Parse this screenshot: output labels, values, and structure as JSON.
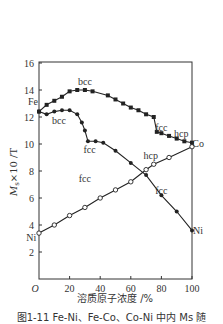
{
  "chart_data": {
    "type": "line",
    "title": "",
    "xlabel": "溶质原子浓度 /%",
    "ylabel": "Ms×10 /T",
    "xlim": [
      0,
      100
    ],
    "ylim": [
      0,
      16
    ],
    "xticks": [
      "O",
      "20",
      "40",
      "60",
      "80",
      "100"
    ],
    "yticks": [
      "2",
      "4",
      "6",
      "8",
      "10",
      "12",
      "14",
      "16"
    ],
    "grid": false,
    "series": [
      {
        "name": "Fe-Co",
        "marker": "filled-square",
        "x": [
          0,
          5,
          10,
          15,
          20,
          25,
          30,
          35,
          45,
          50,
          55,
          60,
          65,
          70,
          75,
          77,
          80,
          85,
          90,
          95,
          100
        ],
        "values": [
          12.4,
          12.9,
          13.2,
          13.5,
          13.9,
          14.0,
          14.0,
          13.9,
          13.6,
          13.3,
          13.0,
          12.7,
          12.5,
          12.2,
          12.0,
          10.9,
          10.8,
          10.6,
          10.4,
          10.2,
          10.1
        ]
      },
      {
        "name": "Fe-Ni",
        "marker": "filled-circle",
        "x": [
          0,
          5,
          10,
          15,
          20,
          25,
          28,
          30,
          32,
          37,
          42,
          50,
          60,
          70,
          80,
          90,
          100
        ],
        "values": [
          12.4,
          12.2,
          12.4,
          12.5,
          12.5,
          12.2,
          11.6,
          11.0,
          10.2,
          10.2,
          10.1,
          9.5,
          8.6,
          7.7,
          6.2,
          5.0,
          3.6
        ]
      },
      {
        "name": "Co-Ni",
        "marker": "open-circle",
        "x": [
          0,
          10,
          20,
          30,
          40,
          50,
          60,
          70,
          75,
          85,
          100
        ],
        "values": [
          3.4,
          4.0,
          4.7,
          5.3,
          6.0,
          6.6,
          7.2,
          8.1,
          8.5,
          9.0,
          9.8
        ]
      }
    ],
    "annotations": [
      {
        "text": "Fe",
        "x": -4,
        "y": 12.9
      },
      {
        "text": "bcc",
        "x": 30,
        "y": 14.4
      },
      {
        "text": "bcc",
        "x": 13,
        "y": 11.5
      },
      {
        "text": "fcc",
        "x": 33,
        "y": 9.3
      },
      {
        "text": "fcc",
        "x": 80,
        "y": 11.0
      },
      {
        "text": "hcp",
        "x": 93,
        "y": 10.5
      },
      {
        "text": "Co",
        "x": 104,
        "y": 9.8
      },
      {
        "text": "hcp",
        "x": 73,
        "y": 8.9
      },
      {
        "text": "fcc",
        "x": 30,
        "y": 7.2
      },
      {
        "text": "fcc",
        "x": 80,
        "y": 6.3
      },
      {
        "text": "Ni",
        "x": -5,
        "y": 2.8
      },
      {
        "text": "Ni",
        "x": 104,
        "y": 3.3
      }
    ]
  },
  "caption": "图1-11  Fe-Ni、Fe-Co、Co-Ni 中内 Ms 随"
}
